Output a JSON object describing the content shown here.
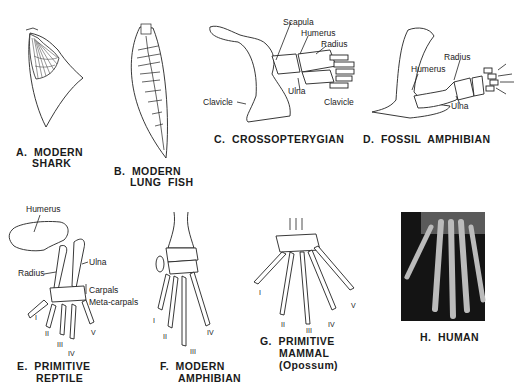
{
  "figure": {
    "panels": [
      {
        "id": "A",
        "caption_line1": "A.  MODERN",
        "caption_line2": "SHARK"
      },
      {
        "id": "B",
        "caption_line1": "B.  MODERN",
        "caption_line2": "LUNG  FISH"
      },
      {
        "id": "C",
        "caption_line1": "C.  CROSSOPTERYGIAN",
        "labels": {
          "scapula": "Scapula",
          "humerus": "Humerus",
          "radius": "Radius",
          "ulna": "Ulna",
          "clavicle": "Clavicle"
        }
      },
      {
        "id": "D",
        "caption_line1": "D.  FOSSIL  AMPHIBIAN",
        "labels": {
          "radius": "Radius",
          "humerus": "Humerus",
          "clavicle": "Clavicle",
          "ulna": "Ulna"
        }
      },
      {
        "id": "E",
        "caption_line1": "E.  PRIMITIVE",
        "caption_line2": "REPTILE",
        "labels": {
          "humerus": "Humerus",
          "ulna": "Ulna",
          "radius": "Radius",
          "carpals": "Carpals",
          "metacarpals": "Meta-carpals"
        },
        "digits": [
          "I",
          "II",
          "III",
          "IV",
          "V"
        ]
      },
      {
        "id": "F",
        "caption_line1": "F.  MODERN",
        "caption_line2": "AMPHIBIAN",
        "digits": [
          "I",
          "II",
          "III",
          "IV"
        ]
      },
      {
        "id": "G",
        "caption_line1": "G.  PRIMITIVE",
        "caption_line2": "MAMMAL",
        "caption_line3": "(Opossum)",
        "digits": [
          "I",
          "II",
          "III",
          "IV",
          "V"
        ]
      },
      {
        "id": "H",
        "caption_line1": "H.  HUMAN"
      }
    ]
  }
}
